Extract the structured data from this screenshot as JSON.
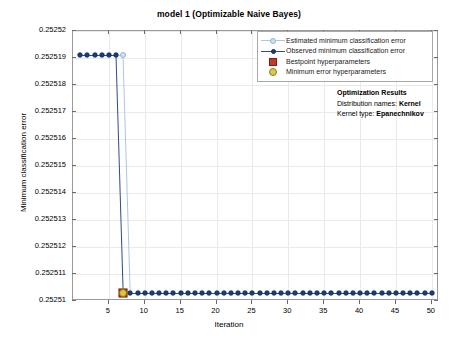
{
  "chart_data": {
    "type": "line",
    "title": "model 1 (Optimizable Naive Bayes)",
    "xlabel": "Iteration",
    "ylabel": "Minimum classification error",
    "xlim": [
      0,
      51
    ],
    "ylim": [
      0.25251,
      0.25252
    ],
    "xticks": [
      5,
      10,
      15,
      20,
      25,
      30,
      35,
      40,
      45,
      50
    ],
    "xtick_labels": [
      "5",
      "10",
      "15",
      "20",
      "25",
      "30",
      "35",
      "40",
      "45",
      "50"
    ],
    "yticks": [
      0.25251,
      0.252511,
      0.252512,
      0.252513,
      0.252514,
      0.252515,
      0.252516,
      0.252517,
      0.252518,
      0.252519,
      0.25252
    ],
    "ytick_labels": [
      "0.25251",
      "0.252511",
      "0.252512",
      "0.252513",
      "0.252514",
      "0.252515",
      "0.252516",
      "0.252517",
      "0.252518",
      "0.252519",
      "0.25252"
    ],
    "grid": true,
    "legend_position": "top-right",
    "series": [
      {
        "name": "Estimated minimum classification error",
        "marker": "open-circle",
        "color": "#a9c8e4",
        "x": [
          1,
          2,
          3,
          4,
          5,
          6,
          7,
          8,
          9,
          10,
          11,
          12,
          13,
          14,
          15,
          16,
          17,
          18,
          19,
          20,
          21,
          22,
          23,
          24,
          25,
          26,
          27,
          28,
          29,
          30,
          31,
          32,
          33,
          34,
          35,
          36,
          37,
          38,
          39,
          40,
          41,
          42,
          43,
          44,
          45,
          46,
          47,
          48,
          49,
          50
        ],
        "y": [
          0.2525191,
          0.2525191,
          0.2525191,
          0.2525191,
          0.2525191,
          0.2525191,
          0.2525191,
          0.2525103,
          0.2525103,
          0.2525103,
          0.2525103,
          0.2525103,
          0.2525103,
          0.2525103,
          0.2525103,
          0.2525103,
          0.2525103,
          0.2525103,
          0.2525103,
          0.2525103,
          0.2525103,
          0.2525103,
          0.2525103,
          0.2525103,
          0.2525103,
          0.2525103,
          0.2525103,
          0.2525103,
          0.2525103,
          0.2525103,
          0.2525103,
          0.2525103,
          0.2525103,
          0.2525103,
          0.2525103,
          0.2525103,
          0.2525103,
          0.2525103,
          0.2525103,
          0.2525103,
          0.2525103,
          0.2525103,
          0.2525103,
          0.2525103,
          0.2525103,
          0.2525103,
          0.2525103,
          0.2525103,
          0.2525103,
          0.2525103
        ]
      },
      {
        "name": "Observed minimum classification error",
        "marker": "filled-circle",
        "color": "#2b4f88",
        "x": [
          1,
          2,
          3,
          4,
          5,
          6,
          7,
          8,
          9,
          10,
          11,
          12,
          13,
          14,
          15,
          16,
          17,
          18,
          19,
          20,
          21,
          22,
          23,
          24,
          25,
          26,
          27,
          28,
          29,
          30,
          31,
          32,
          33,
          34,
          35,
          36,
          37,
          38,
          39,
          40,
          41,
          42,
          43,
          44,
          45,
          46,
          47,
          48,
          49,
          50
        ],
        "y": [
          0.2525191,
          0.2525191,
          0.2525191,
          0.2525191,
          0.2525191,
          0.2525191,
          0.2525103,
          0.2525103,
          0.2525103,
          0.2525103,
          0.2525103,
          0.2525103,
          0.2525103,
          0.2525103,
          0.2525103,
          0.2525103,
          0.2525103,
          0.2525103,
          0.2525103,
          0.2525103,
          0.2525103,
          0.2525103,
          0.2525103,
          0.2525103,
          0.2525103,
          0.2525103,
          0.2525103,
          0.2525103,
          0.2525103,
          0.2525103,
          0.2525103,
          0.2525103,
          0.2525103,
          0.2525103,
          0.2525103,
          0.2525103,
          0.2525103,
          0.2525103,
          0.2525103,
          0.2525103,
          0.2525103,
          0.2525103,
          0.2525103,
          0.2525103,
          0.2525103,
          0.2525103,
          0.2525103,
          0.2525103,
          0.2525103,
          0.2525103
        ]
      }
    ],
    "markers": [
      {
        "name": "Bestpoint hyperparameters",
        "shape": "square",
        "color": "#c0392b",
        "x": 7,
        "y": 0.2525103
      },
      {
        "name": "Minimum error hyperparameters",
        "shape": "circle",
        "color": "#d8c84a",
        "x": 7,
        "y": 0.2525103
      }
    ],
    "legend": [
      {
        "label": "Estimated minimum classification error",
        "symbol": "open-circle-line",
        "color": "#a9c8e4"
      },
      {
        "label": "Observed minimum classification error",
        "symbol": "filled-circle-line",
        "color": "#2b4f88"
      },
      {
        "label": "Bestpoint hyperparameters",
        "symbol": "square",
        "color": "#c0392b"
      },
      {
        "label": "Minimum error hyperparameters",
        "symbol": "circle",
        "color": "#d8c84a"
      }
    ],
    "annotation": {
      "heading": "Optimization Results",
      "lines": [
        {
          "label": "Distribution names:",
          "value": "Kernel"
        },
        {
          "label": "Kernel type:",
          "value": "Epanechnikov"
        }
      ]
    }
  }
}
